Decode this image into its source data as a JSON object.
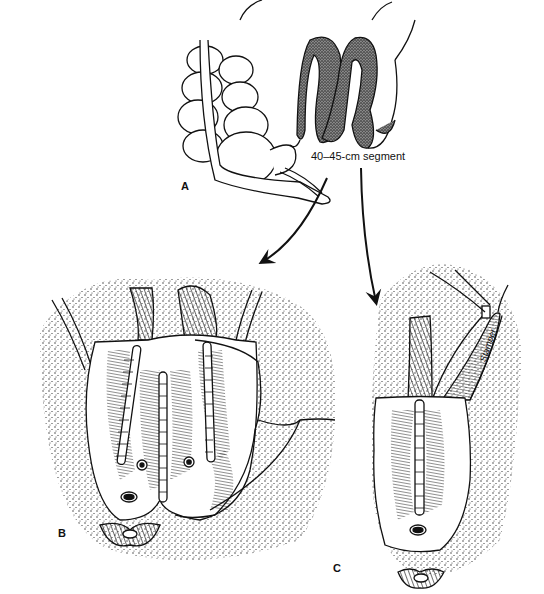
{
  "figure": {
    "panels": [
      {
        "id": "A",
        "label": "A",
        "description": "Colon and small bowel with stippled 40-45 cm ileal segment"
      },
      {
        "id": "B",
        "label": "B",
        "description": "Folded ileal segment sutured into pouch (three rows of sutures)"
      },
      {
        "id": "C",
        "label": "C",
        "description": "Tubularized segment with single suture line and stoma"
      }
    ],
    "callout": {
      "text": "40–45-cm segment"
    },
    "signature": {
      "text": "Stamper"
    },
    "colors": {
      "ink": "#111111",
      "background": "#ffffff",
      "stipple": "#222222"
    }
  }
}
